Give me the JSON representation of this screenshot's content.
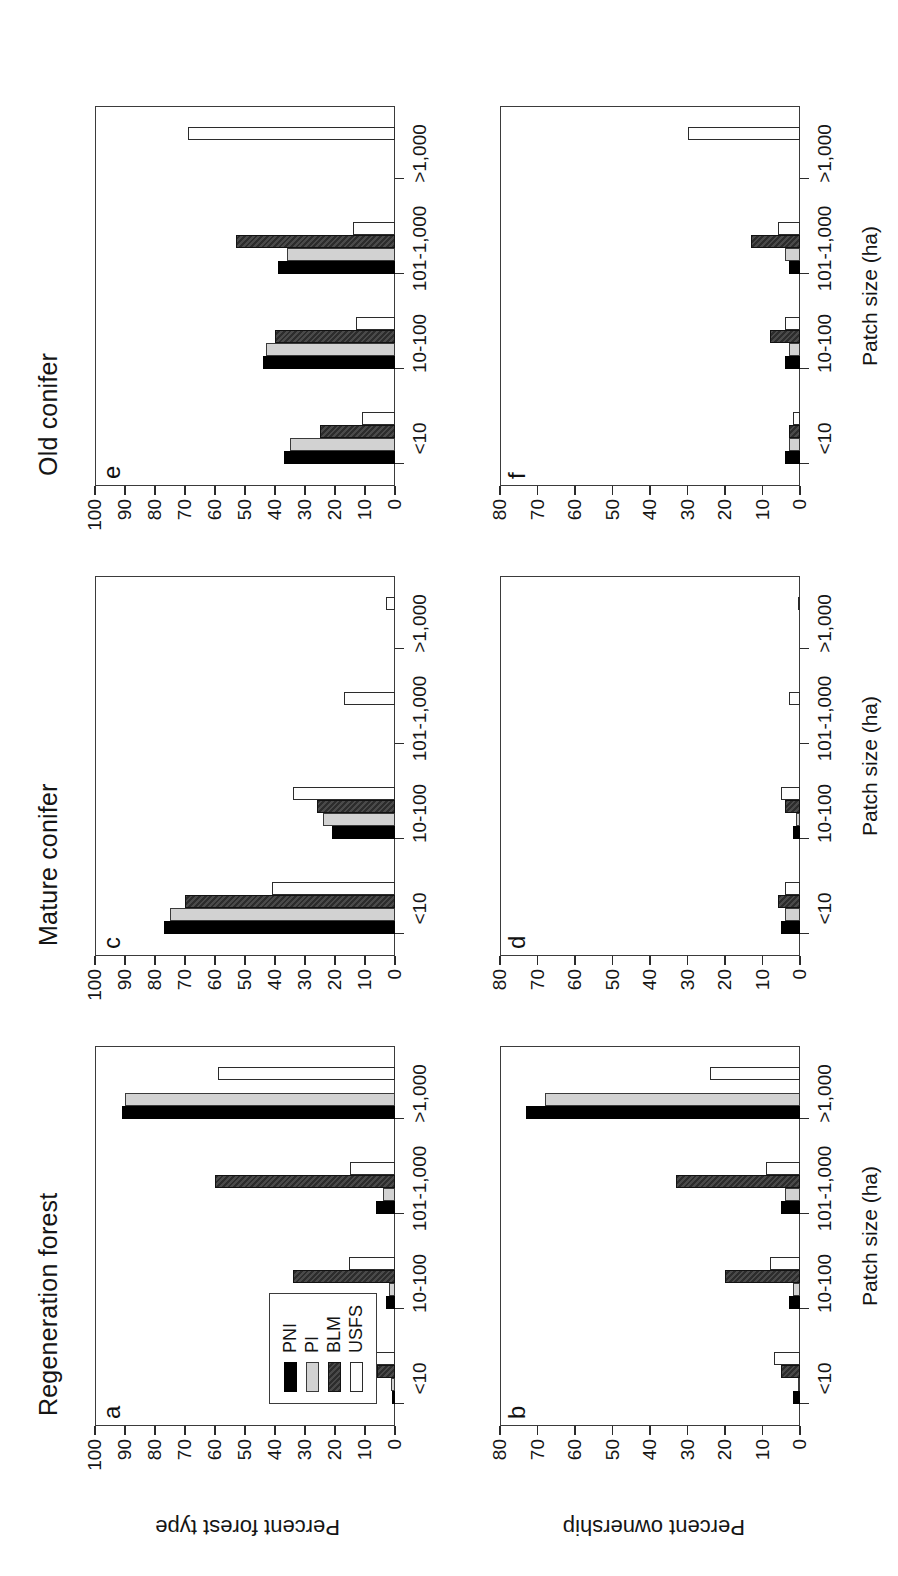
{
  "figure": {
    "column_titles": [
      "Regeneration forest",
      "Mature conifer",
      "Old conifer"
    ],
    "row_axis_titles": [
      "Percent forest type",
      "Percent ownership"
    ],
    "x_axis_title": "Patch size (ha)",
    "panel_letters": [
      "a",
      "b",
      "c",
      "d",
      "e",
      "f"
    ]
  },
  "legend": {
    "entries": [
      {
        "label": "PNI",
        "swatch": "black"
      },
      {
        "label": "PI",
        "swatch": "light-gray"
      },
      {
        "label": "BLM",
        "swatch": "dark-gray-hatched"
      },
      {
        "label": "USFS",
        "swatch": "white"
      }
    ]
  },
  "colors": {
    "pni": "#000000",
    "pi": "#d2d2d2",
    "blm": "#3a3a3a",
    "usfs": "#fdfdfd",
    "axis": "#2b2b2b",
    "frame": "#3b3b3b"
  },
  "chart_data": [
    {
      "type": "bar",
      "panel": "a",
      "title": "Regeneration forest",
      "xlabel": "Patch size (ha)",
      "ylabel": "Percent forest type",
      "ylim": [
        0,
        100
      ],
      "yticks": [
        0,
        10,
        20,
        30,
        40,
        50,
        60,
        70,
        80,
        90,
        100
      ],
      "categories": [
        "<10",
        "10-100",
        "101-1,000",
        ">1,000"
      ],
      "series": [
        {
          "name": "PNI",
          "values": [
            1,
            3,
            6.5,
            91
          ]
        },
        {
          "name": "PI",
          "values": [
            1.5,
            2,
            4,
            90
          ]
        },
        {
          "name": "BLM",
          "values": [
            6,
            34,
            60,
            0
          ]
        },
        {
          "name": "USFS",
          "values": [
            8,
            15.5,
            15,
            59
          ]
        }
      ],
      "grid": false,
      "legend_position": "lower-left"
    },
    {
      "type": "bar",
      "panel": "b",
      "title": "Regeneration forest",
      "xlabel": "Patch size (ha)",
      "ylabel": "Percent ownership",
      "ylim": [
        0,
        80
      ],
      "yticks": [
        0,
        10,
        20,
        30,
        40,
        50,
        60,
        70,
        80
      ],
      "categories": [
        "<10",
        "10-100",
        "101-1,000",
        ">1,000"
      ],
      "series": [
        {
          "name": "PNI",
          "values": [
            2,
            3,
            5,
            73
          ]
        },
        {
          "name": "PI",
          "values": [
            0.5,
            2,
            4,
            68
          ]
        },
        {
          "name": "BLM",
          "values": [
            5,
            20,
            33,
            0
          ]
        },
        {
          "name": "USFS",
          "values": [
            7,
            8,
            9,
            24
          ]
        }
      ],
      "grid": false,
      "legend_position": "none"
    },
    {
      "type": "bar",
      "panel": "c",
      "title": "Mature conifer",
      "xlabel": "Patch size (ha)",
      "ylabel": "Percent forest type",
      "ylim": [
        0,
        100
      ],
      "yticks": [
        0,
        10,
        20,
        30,
        40,
        50,
        60,
        70,
        80,
        90,
        100
      ],
      "categories": [
        "<10",
        "10-100",
        "101-1,000",
        ">1,000"
      ],
      "series": [
        {
          "name": "PNI",
          "values": [
            77,
            21,
            0,
            0
          ]
        },
        {
          "name": "PI",
          "values": [
            75,
            24,
            0,
            0
          ]
        },
        {
          "name": "BLM",
          "values": [
            70,
            26,
            0,
            0
          ]
        },
        {
          "name": "USFS",
          "values": [
            41,
            34,
            17,
            3
          ]
        }
      ],
      "grid": false,
      "legend_position": "none"
    },
    {
      "type": "bar",
      "panel": "d",
      "title": "Mature conifer",
      "xlabel": "Patch size (ha)",
      "ylabel": "Percent ownership",
      "ylim": [
        0,
        80
      ],
      "yticks": [
        0,
        10,
        20,
        30,
        40,
        50,
        60,
        70,
        80
      ],
      "categories": [
        "<10",
        "10-100",
        "101-1,000",
        ">1,000"
      ],
      "series": [
        {
          "name": "PNI",
          "values": [
            5,
            2,
            0,
            0
          ]
        },
        {
          "name": "PI",
          "values": [
            4,
            1,
            0,
            0
          ]
        },
        {
          "name": "BLM",
          "values": [
            6,
            4,
            0,
            0
          ]
        },
        {
          "name": "USFS",
          "values": [
            4,
            5,
            3,
            0.5
          ]
        }
      ],
      "grid": false,
      "legend_position": "none"
    },
    {
      "type": "bar",
      "panel": "e",
      "title": "Old conifer",
      "xlabel": "Patch size (ha)",
      "ylabel": "Percent forest type",
      "ylim": [
        0,
        100
      ],
      "yticks": [
        0,
        10,
        20,
        30,
        40,
        50,
        60,
        70,
        80,
        90,
        100
      ],
      "categories": [
        "<10",
        "10-100",
        "101-1,000",
        ">1,000"
      ],
      "series": [
        {
          "name": "PNI",
          "values": [
            37,
            44,
            39,
            0
          ]
        },
        {
          "name": "PI",
          "values": [
            35,
            43,
            36,
            0
          ]
        },
        {
          "name": "BLM",
          "values": [
            25,
            40,
            53,
            0
          ]
        },
        {
          "name": "USFS",
          "values": [
            11,
            13,
            14,
            69
          ]
        }
      ],
      "grid": false,
      "legend_position": "none"
    },
    {
      "type": "bar",
      "panel": "f",
      "title": "Old conifer",
      "xlabel": "Patch size (ha)",
      "ylabel": "Percent ownership",
      "ylim": [
        0,
        80
      ],
      "yticks": [
        0,
        10,
        20,
        30,
        40,
        50,
        60,
        70,
        80
      ],
      "categories": [
        "<10",
        "10-100",
        "101-1,000",
        ">1,000"
      ],
      "series": [
        {
          "name": "PNI",
          "values": [
            4,
            4,
            3,
            0
          ]
        },
        {
          "name": "PI",
          "values": [
            3,
            3,
            4,
            0
          ]
        },
        {
          "name": "BLM",
          "values": [
            3,
            8,
            13,
            0
          ]
        },
        {
          "name": "USFS",
          "values": [
            2,
            4,
            6,
            30
          ]
        }
      ],
      "grid": false,
      "legend_position": "none"
    }
  ]
}
